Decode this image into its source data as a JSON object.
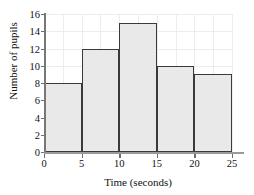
{
  "chart_data": {
    "type": "bar",
    "title": "",
    "subtitle": "",
    "xlabel": "Time (seconds)",
    "ylabel": "Number of pupils",
    "categories": [
      "0-5",
      "5-10",
      "10-15",
      "15-20",
      "20-25"
    ],
    "bin_edges": [
      0,
      5,
      10,
      15,
      20,
      25
    ],
    "values": [
      8,
      12,
      15,
      10,
      9
    ],
    "xlim": [
      0,
      25
    ],
    "ylim": [
      0,
      16
    ],
    "x_ticks": [
      0,
      5,
      10,
      15,
      20,
      25
    ],
    "x_tick_labels": [
      "0",
      "5",
      "10",
      "15",
      "20",
      "25"
    ],
    "y_ticks": [
      0,
      2,
      4,
      6,
      8,
      10,
      12,
      14,
      16
    ],
    "y_tick_labels": [
      "0",
      "2",
      "4",
      "6",
      "8",
      "10",
      "12",
      "14",
      "16"
    ],
    "grid": true,
    "legend": false,
    "bar_fill_color": "#e9e9e9",
    "bar_edge_color": "#3a3a3a",
    "grid_color": "#ececec",
    "axis_color": "#777777",
    "text_color": "#111111"
  }
}
